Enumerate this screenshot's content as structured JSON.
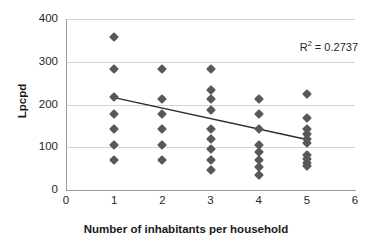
{
  "chart_data": {
    "type": "scatter",
    "title": "",
    "xlabel": "Number of inhabitants per household",
    "ylabel": "Lpcpd",
    "xlim": [
      0,
      6
    ],
    "ylim": [
      0,
      400
    ],
    "xticks": [
      "0",
      "1",
      "2",
      "3",
      "4",
      "5",
      "6"
    ],
    "yticks": [
      "0",
      "100",
      "200",
      "300",
      "400"
    ],
    "grid": "horizontal",
    "legend": "none",
    "marker_color": "#58585a",
    "marker_shape": "diamond",
    "gridline_color": "#d4d4d4",
    "axis_color": "#9a9a9a",
    "annotations": [
      {
        "text": "R² = 0.2737",
        "label": "R",
        "sup": "2",
        "rest": " = 0.2737"
      }
    ],
    "r_squared": 0.2737,
    "points": [
      {
        "x": 1,
        "y": 357
      },
      {
        "x": 1,
        "y": 284
      },
      {
        "x": 1,
        "y": 217
      },
      {
        "x": 1,
        "y": 178
      },
      {
        "x": 1,
        "y": 142
      },
      {
        "x": 1,
        "y": 106
      },
      {
        "x": 1,
        "y": 71
      },
      {
        "x": 2,
        "y": 284
      },
      {
        "x": 2,
        "y": 212
      },
      {
        "x": 2,
        "y": 178
      },
      {
        "x": 2,
        "y": 142
      },
      {
        "x": 2,
        "y": 106
      },
      {
        "x": 2,
        "y": 71
      },
      {
        "x": 3,
        "y": 284
      },
      {
        "x": 3,
        "y": 235
      },
      {
        "x": 3,
        "y": 212
      },
      {
        "x": 3,
        "y": 188
      },
      {
        "x": 3,
        "y": 142
      },
      {
        "x": 3,
        "y": 119
      },
      {
        "x": 3,
        "y": 95
      },
      {
        "x": 3,
        "y": 71
      },
      {
        "x": 3,
        "y": 47
      },
      {
        "x": 4,
        "y": 212
      },
      {
        "x": 4,
        "y": 178
      },
      {
        "x": 4,
        "y": 142
      },
      {
        "x": 4,
        "y": 106
      },
      {
        "x": 4,
        "y": 88
      },
      {
        "x": 4,
        "y": 71
      },
      {
        "x": 4,
        "y": 53
      },
      {
        "x": 4,
        "y": 35
      },
      {
        "x": 5,
        "y": 225
      },
      {
        "x": 5,
        "y": 169
      },
      {
        "x": 5,
        "y": 142
      },
      {
        "x": 5,
        "y": 130
      },
      {
        "x": 5,
        "y": 119
      },
      {
        "x": 5,
        "y": 111
      },
      {
        "x": 5,
        "y": 83
      },
      {
        "x": 5,
        "y": 72
      },
      {
        "x": 5,
        "y": 64
      },
      {
        "x": 5,
        "y": 56
      }
    ],
    "trendline": {
      "x0": 1,
      "y0": 216,
      "x1": 5,
      "y1": 118,
      "color": "#2b2b2b"
    }
  }
}
